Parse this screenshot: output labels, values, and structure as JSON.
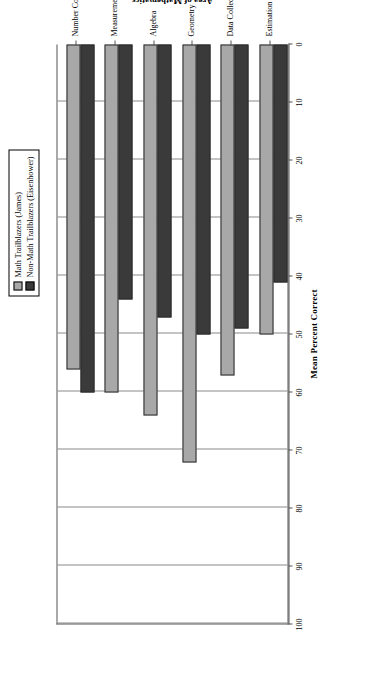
{
  "chart_data": {
    "type": "bar",
    "orientation": "horizontal",
    "title": "",
    "xlabel": "Area of Mathematics",
    "ylabel": "Mean Percent Correct",
    "ylim": [
      0,
      100
    ],
    "ticks": [
      "0",
      "10",
      "20",
      "30",
      "40",
      "50",
      "60",
      "70",
      "80",
      "90",
      "100"
    ],
    "grid": true,
    "legend_position": "top-center",
    "categories": [
      "Number Concepts",
      "Measurement",
      "Algebra",
      "Geometry",
      "Data Collection",
      "Estimation"
    ],
    "series": [
      {
        "name": "Math Trailblazers (James)",
        "color": "#a8a8a8",
        "values": [
          56,
          60,
          64,
          72,
          57,
          50
        ]
      },
      {
        "name": "Non-Math Trailblazers (Eisenhower)",
        "color": "#3a3a3a",
        "values": [
          60,
          44,
          47,
          50,
          49,
          41
        ]
      }
    ]
  },
  "legend": {
    "items": [
      {
        "label": "Math Trailblazers (James)",
        "color": "#a8a8a8"
      },
      {
        "label": "Non-Math Trailblazers (Eisenhower)",
        "color": "#3a3a3a"
      }
    ]
  },
  "axes": {
    "value_axis_title": "Mean Percent Correct",
    "category_axis_title": "Area of Mathematics"
  }
}
